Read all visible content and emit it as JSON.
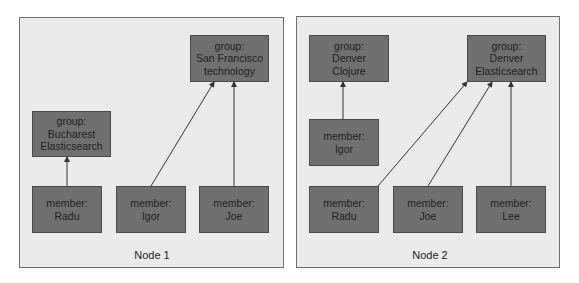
{
  "nodes": [
    {
      "label": "Node 1",
      "groups": [
        {
          "line1": "group:",
          "line2": "Bucharest",
          "line3": "Elasticsearch"
        },
        {
          "line1": "group:",
          "line2": "San Francisco",
          "line3": "technology"
        }
      ],
      "members": [
        {
          "line1": "member:",
          "line2": "Radu",
          "group": "Bucharest Elasticsearch"
        },
        {
          "line1": "member:",
          "line2": "Igor",
          "group": "San Francisco technology"
        },
        {
          "line1": "member:",
          "line2": "Joe",
          "group": "San Francisco technology"
        }
      ]
    },
    {
      "label": "Node 2",
      "groups": [
        {
          "line1": "group:",
          "line2": "Denver",
          "line3": "Clojure"
        },
        {
          "line1": "group:",
          "line2": "Denver",
          "line3": "Elasticsearch"
        }
      ],
      "members": [
        {
          "line1": "member:",
          "line2": "Igor",
          "group": "Denver Clojure"
        },
        {
          "line1": "member:",
          "line2": "Radu",
          "group": "Denver Elasticsearch"
        },
        {
          "line1": "member:",
          "line2": "Joe",
          "group": "Denver Elasticsearch"
        },
        {
          "line1": "member:",
          "line2": "Lee",
          "group": "Denver Elasticsearch"
        }
      ]
    }
  ],
  "colors": {
    "panel_bg": "#ebebeb",
    "panel_border": "#6e6e6e",
    "box_fill": "#707070",
    "box_border": "#4a4a4a",
    "arrow": "#333333"
  }
}
